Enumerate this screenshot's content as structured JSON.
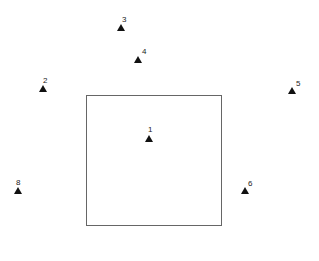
{
  "diagram": {
    "box": {
      "left": 86,
      "top": 95,
      "right": 222,
      "bottom": 226,
      "stroke": "#666666"
    },
    "points": [
      {
        "label": "1",
        "x": 149,
        "y": 139
      },
      {
        "label": "2",
        "x": 43,
        "y": 89
      },
      {
        "label": "3",
        "x": 121,
        "y": 28
      },
      {
        "label": "4",
        "x": 138,
        "y": 60
      },
      {
        "label": "5",
        "x": 292,
        "y": 91
      },
      {
        "label": "6",
        "x": 245,
        "y": 191
      },
      {
        "label": "8",
        "x": 18,
        "y": 191
      }
    ],
    "marker_icon": "triangle-up-icon",
    "marker_color": "#111111"
  }
}
